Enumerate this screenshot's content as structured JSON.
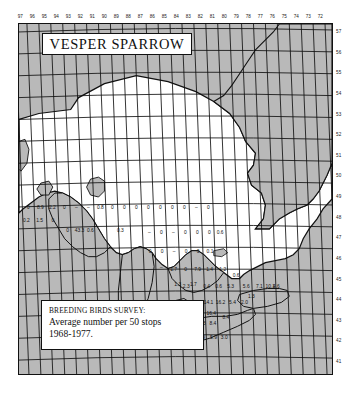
{
  "figure": {
    "title": "VESPER SPARROW",
    "legend": {
      "line1": "BREEDING BIRDS SURVEY:",
      "line2": "Average number per 50 stops",
      "line3": "1968-1977."
    },
    "colors": {
      "land": "#ffffff",
      "water_outside": "#b9b9b9",
      "grid": "#111111",
      "ink": "#111111"
    }
  },
  "chart_data": {
    "type": "heatmap",
    "title": "VESPER SPARROW",
    "subtitle": "BREEDING BIRDS SURVEY: Average number per 50 stops 1968-1977.",
    "xlabel": "West longitude (degrees)",
    "ylabel": "North latitude (degrees)",
    "grid": true,
    "legend_position": "bottom-left",
    "x_ticks": [
      97,
      96,
      95,
      94,
      93,
      92,
      91,
      90,
      89,
      88,
      87,
      86,
      85,
      84,
      83,
      82,
      81,
      80,
      79,
      78,
      77,
      76,
      75,
      74,
      73,
      72
    ],
    "y_ticks": [
      57,
      56,
      55,
      54,
      53,
      52,
      51,
      50,
      49,
      48,
      47,
      46,
      45,
      44,
      43,
      42,
      41
    ],
    "xlim": [
      97,
      72
    ],
    "ylim": [
      41,
      57
    ],
    "value_unit": "average number per 50 stops",
    "cells": [
      {
        "lon": 96.5,
        "lat": 48.5,
        "value": "0"
      },
      {
        "lon": 95.5,
        "lat": 48.5,
        "value": "8.9"
      },
      {
        "lon": 94.5,
        "lat": 48.5,
        "value": "2.2"
      },
      {
        "lon": 93.5,
        "lat": 48.5,
        "value": "0"
      },
      {
        "lon": 92.5,
        "lat": 48.5,
        "value": "–"
      },
      {
        "lon": 91.5,
        "lat": 48.5,
        "value": "–"
      },
      {
        "lon": 90.5,
        "lat": 48.5,
        "value": "0.8"
      },
      {
        "lon": 89.5,
        "lat": 48.5,
        "value": "0"
      },
      {
        "lon": 88.5,
        "lat": 48.5,
        "value": "0"
      },
      {
        "lon": 87.5,
        "lat": 48.5,
        "value": "0"
      },
      {
        "lon": 86.5,
        "lat": 48.5,
        "value": "0"
      },
      {
        "lon": 85.5,
        "lat": 48.5,
        "value": "0"
      },
      {
        "lon": 84.5,
        "lat": 48.5,
        "value": "0"
      },
      {
        "lon": 83.5,
        "lat": 48.5,
        "value": "0"
      },
      {
        "lon": 82.5,
        "lat": 48.5,
        "value": "–"
      },
      {
        "lon": 81.5,
        "lat": 48.5,
        "value": "0"
      },
      {
        "lon": 96.7,
        "lat": 47.9,
        "value": "0.2"
      },
      {
        "lon": 95.6,
        "lat": 47.9,
        "value": "1.5"
      },
      {
        "lon": 94.5,
        "lat": 47.9,
        "value": "0"
      },
      {
        "lon": 93.3,
        "lat": 47.4,
        "value": "0"
      },
      {
        "lon": 92.3,
        "lat": 47.4,
        "value": "43.3"
      },
      {
        "lon": 91.4,
        "lat": 47.4,
        "value": "0.6"
      },
      {
        "lon": 88.9,
        "lat": 47.4,
        "value": "0.3"
      },
      {
        "lon": 86.5,
        "lat": 47.3,
        "value": "–"
      },
      {
        "lon": 85.5,
        "lat": 47.3,
        "value": "0"
      },
      {
        "lon": 84.5,
        "lat": 47.3,
        "value": "–"
      },
      {
        "lon": 83.5,
        "lat": 47.3,
        "value": "0"
      },
      {
        "lon": 82.5,
        "lat": 47.3,
        "value": "0"
      },
      {
        "lon": 81.5,
        "lat": 47.3,
        "value": "0"
      },
      {
        "lon": 80.6,
        "lat": 47.3,
        "value": "0.6"
      },
      {
        "lon": 86.5,
        "lat": 46.4,
        "value": "0"
      },
      {
        "lon": 85.5,
        "lat": 46.4,
        "value": "0"
      },
      {
        "lon": 84.5,
        "lat": 46.4,
        "value": "–"
      },
      {
        "lon": 83.5,
        "lat": 46.4,
        "value": "0"
      },
      {
        "lon": 82.5,
        "lat": 46.4,
        "value": "0"
      },
      {
        "lon": 81.5,
        "lat": 46.4,
        "value": "0.1"
      },
      {
        "lon": 85.6,
        "lat": 45.6,
        "value": "–"
      },
      {
        "lon": 84.6,
        "lat": 45.5,
        "value": "1.7"
      },
      {
        "lon": 83.6,
        "lat": 45.5,
        "value": "0"
      },
      {
        "lon": 82.6,
        "lat": 45.5,
        "value": "7.9"
      },
      {
        "lon": 81.6,
        "lat": 45.5,
        "value": "1.4"
      },
      {
        "lon": 80.5,
        "lat": 45.5,
        "value": "1.2"
      },
      {
        "lon": 79.4,
        "lat": 45.2,
        "value": "0.6"
      },
      {
        "lon": 83.0,
        "lat": 44.8,
        "value": "1.7"
      },
      {
        "lon": 83.6,
        "lat": 44.7,
        "value": "2.3"
      },
      {
        "lon": 84.3,
        "lat": 44.8,
        "value": "1.3"
      },
      {
        "lon": 81.9,
        "lat": 44.7,
        "value": "0.4"
      },
      {
        "lon": 80.9,
        "lat": 44.7,
        "value": "0.6"
      },
      {
        "lon": 79.9,
        "lat": 44.7,
        "value": "5.3"
      },
      {
        "lon": 78.6,
        "lat": 44.7,
        "value": "5.6"
      },
      {
        "lon": 77.5,
        "lat": 44.7,
        "value": "7.1"
      },
      {
        "lon": 76.6,
        "lat": 44.7,
        "value": "10.1"
      },
      {
        "lon": 76.1,
        "lat": 44.7,
        "value": "4.6"
      },
      {
        "lon": 78.2,
        "lat": 44.2,
        "value": "1.3"
      },
      {
        "lon": 81.8,
        "lat": 43.9,
        "value": "14.1"
      },
      {
        "lon": 80.8,
        "lat": 43.9,
        "value": "16.2"
      },
      {
        "lon": 79.8,
        "lat": 43.9,
        "value": "5.4"
      },
      {
        "lon": 78.8,
        "lat": 43.9,
        "value": "2.0"
      },
      {
        "lon": 82.5,
        "lat": 43.4,
        "value": "5.6"
      },
      {
        "lon": 81.6,
        "lat": 43.4,
        "value": "16.4"
      },
      {
        "lon": 80.4,
        "lat": 43.2,
        "value": "8.4"
      },
      {
        "lon": 82.5,
        "lat": 42.9,
        "value": "16.3"
      },
      {
        "lon": 81.5,
        "lat": 42.9,
        "value": "8.4"
      },
      {
        "lon": 83.3,
        "lat": 42.2,
        "value": "23.8"
      },
      {
        "lon": 82.5,
        "lat": 42.2,
        "value": "6.9"
      },
      {
        "lon": 81.5,
        "lat": 42.2,
        "value": "5.9"
      },
      {
        "lon": 80.6,
        "lat": 42.2,
        "value": "3.0"
      }
    ]
  }
}
